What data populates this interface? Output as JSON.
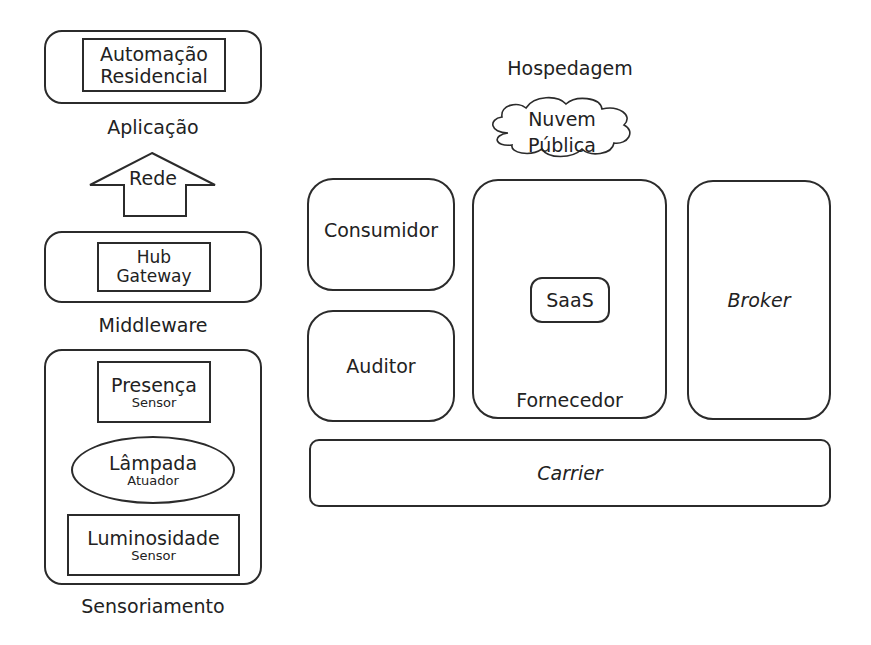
{
  "left_stack": {
    "application": {
      "inner_line1": "Automação",
      "inner_line2": "Residencial",
      "caption": "Aplicação"
    },
    "network_arrow": {
      "label": "Rede",
      "icon": "up-arrow-icon"
    },
    "middleware": {
      "inner_line1": "Hub",
      "inner_line2": "Gateway",
      "caption": "Middleware"
    },
    "sensing": {
      "items": [
        {
          "title": "Presença",
          "subtitle": "Sensor",
          "shape": "rectangle"
        },
        {
          "title": "Lâmpada",
          "subtitle": "Atuador",
          "shape": "ellipse"
        },
        {
          "title": "Luminosidade",
          "subtitle": "Sensor",
          "shape": "rectangle"
        }
      ],
      "caption": "Sensoriamento"
    }
  },
  "right_model": {
    "hosting_label": "Hospedagem",
    "cloud": {
      "line1": "Nuvem",
      "line2": "Pública",
      "icon": "cloud-icon"
    },
    "consumer": "Consumidor",
    "auditor": "Auditor",
    "provider": {
      "service": "SaaS",
      "caption": "Fornecedor"
    },
    "broker": "Broker",
    "carrier": "Carrier"
  }
}
